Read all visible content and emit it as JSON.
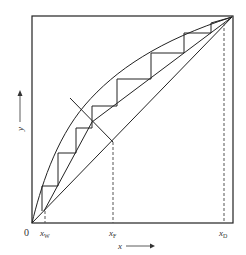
{
  "diagram": {
    "type": "McCabe-Thiele distillation diagram",
    "axes": {
      "x_label": "x",
      "y_label": "y",
      "origin_label": "0"
    },
    "x_ticks": [
      {
        "label": "x",
        "sub": "W",
        "name": "xW"
      },
      {
        "label": "x",
        "sub": "F",
        "name": "xF"
      },
      {
        "label": "x",
        "sub": "D",
        "name": "xD"
      }
    ],
    "colors": {
      "line": "#222222",
      "dashed": "#555555",
      "text": "#333333",
      "background": "#ffffff"
    }
  }
}
